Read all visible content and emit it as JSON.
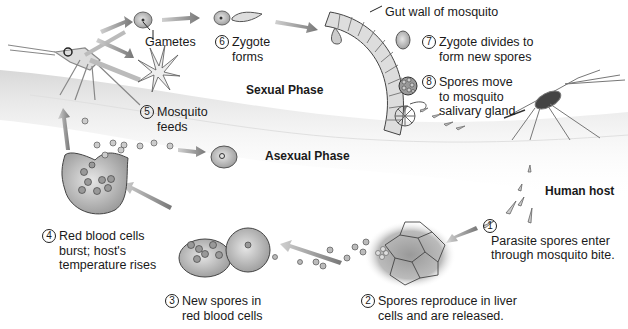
{
  "diagram": {
    "phases": {
      "sexual": "Sexual Phase",
      "asexual": "Asexual Phase"
    },
    "labels": {
      "gametes": "Gametes",
      "gut_wall": "Gut wall of mosquito",
      "human_host": "Human host"
    },
    "steps": [
      {
        "num": "1",
        "line1": "Parasite spores enter",
        "line2": "through mosquito bite."
      },
      {
        "num": "2",
        "line1": "Spores reproduce in liver",
        "line2": "cells and are released."
      },
      {
        "num": "3",
        "line1": "New spores in",
        "line2": "red blood cells"
      },
      {
        "num": "4",
        "line1": "Red blood cells",
        "line2": "burst; host's",
        "line3": "temperature rises"
      },
      {
        "num": "5",
        "line1": "Mosquito",
        "line2": "feeds"
      },
      {
        "num": "6",
        "line1": "Zygote",
        "line2": "forms"
      },
      {
        "num": "7",
        "line1": "Zygote divides to",
        "line2": "form new spores"
      },
      {
        "num": "8",
        "line1": "Spores move",
        "line2": "to mosquito",
        "line3": "salivary gland"
      }
    ]
  }
}
